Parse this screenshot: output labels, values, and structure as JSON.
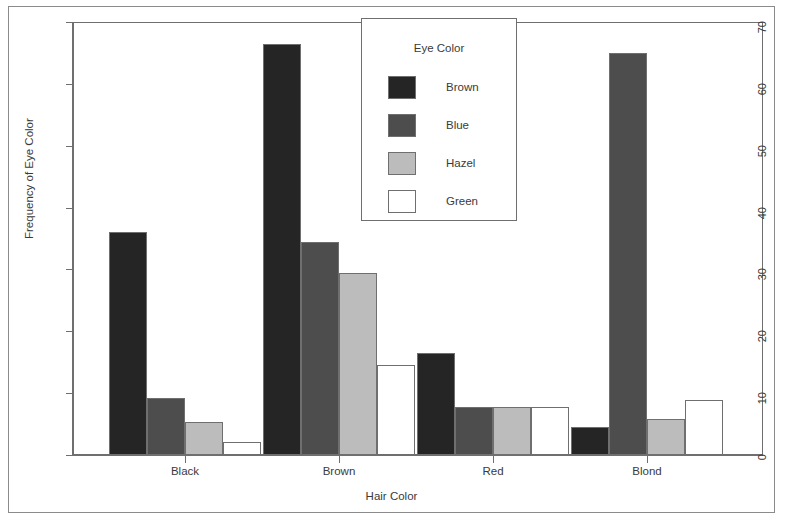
{
  "figure": {
    "border_color": "#8b8b8b"
  },
  "chart_data": {
    "type": "bar",
    "title": "",
    "xlabel": "Hair Color",
    "ylabel": "Frequency of Eye Color",
    "categories": [
      "Black",
      "Brown",
      "Red",
      "Blond"
    ],
    "ylim": [
      0,
      70
    ],
    "yticks": [
      0,
      10,
      20,
      30,
      40,
      50,
      60,
      70
    ],
    "ytick_labels": [
      "0",
      "10",
      "20",
      "30",
      "40",
      "50",
      "60",
      "70"
    ],
    "grid": false,
    "legend_title": "Eye Color",
    "legend_position": "top-center",
    "series": [
      {
        "name": "Brown",
        "color": "#252525",
        "values": [
          36.0,
          66.5,
          16.5,
          4.5
        ]
      },
      {
        "name": "Blue",
        "color": "#4d4d4d",
        "values": [
          9.2,
          34.5,
          7.7,
          65.0
        ]
      },
      {
        "name": "Hazel",
        "color": "#bcbcbc",
        "values": [
          5.3,
          29.5,
          7.7,
          5.8
        ]
      },
      {
        "name": "Green",
        "color": "#ffffff",
        "values": [
          2.1,
          14.5,
          7.7,
          8.9
        ]
      }
    ],
    "axis_color": "#6f6f6f",
    "bar_edge_color": "#6f6f6f",
    "text_color": "#3a3a3a"
  }
}
